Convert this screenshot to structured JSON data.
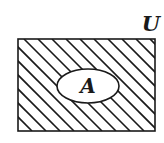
{
  "diagram": {
    "type": "venn",
    "universal_set": {
      "label": "U",
      "shading": "hatched"
    },
    "sets": [
      {
        "label": "A",
        "shading": "none"
      }
    ],
    "shaded_region": "complement of A in U",
    "colors": {
      "stroke": "#1a1a1a",
      "background": "#ffffff"
    }
  }
}
